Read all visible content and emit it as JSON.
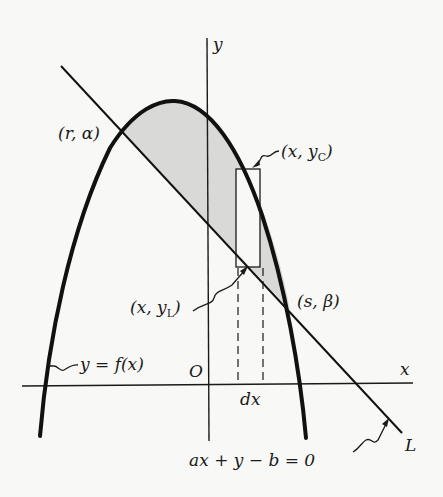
{
  "figure": {
    "colors": {
      "ink": "#1a1a1a",
      "shade": "#d9d9d7",
      "background": "#f8f8f6"
    }
  },
  "axes": {
    "y_label": "y",
    "x_label": "x",
    "origin_label": "O"
  },
  "curve": {
    "label": "y = f(x)"
  },
  "line": {
    "name": "L",
    "equation": "ax + y − b  =  0"
  },
  "points": {
    "left_intersection": "(r, α)",
    "right_intersection": "(s, β)",
    "curve_point": {
      "prefix": "(x, y",
      "subscript": "C",
      "suffix": ")"
    },
    "line_point": {
      "prefix": "(x, y",
      "subscript": "L",
      "suffix": ")"
    }
  },
  "strip": {
    "width_label": "dx"
  }
}
